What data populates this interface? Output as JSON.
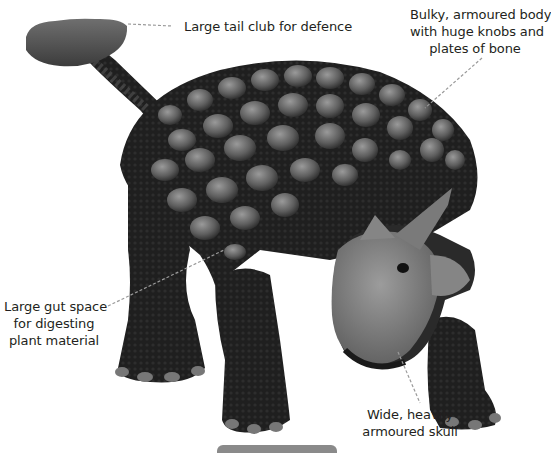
{
  "figure": {
    "colors": {
      "background": "#ffffff",
      "text": "#231f20",
      "leader_line": "#9a9a9a",
      "body_dark": "#1e1e1e",
      "armour_knob": "#6e6e6e",
      "skull": "#7c7c7c",
      "tab_bar": "#8a8a8a"
    }
  },
  "annotations": [
    {
      "id": "tail-club",
      "lines": [
        "Large tail club for defence"
      ]
    },
    {
      "id": "body",
      "lines": [
        "Bulky, armoured body",
        "with huge knobs and",
        "plates of bone"
      ]
    },
    {
      "id": "gut",
      "lines": [
        "Large gut space",
        "for digesting",
        "plant material"
      ]
    },
    {
      "id": "skull",
      "lines": [
        "Wide, heavily",
        "armoured skull"
      ]
    }
  ]
}
